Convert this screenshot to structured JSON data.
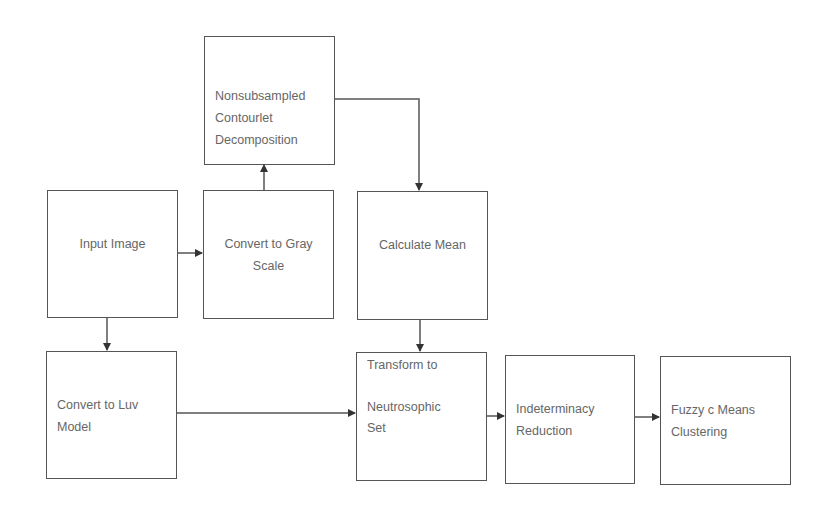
{
  "diagram": {
    "type": "flowchart",
    "nodes": [
      {
        "id": "nsct",
        "label_lines": [
          "Nonsubsampled",
          "Contourlet",
          "Decomposition"
        ]
      },
      {
        "id": "input",
        "label_lines": [
          "Input Image"
        ]
      },
      {
        "id": "gray",
        "label_lines": [
          "Convert to Gray",
          "Scale"
        ]
      },
      {
        "id": "mean",
        "label_lines": [
          "Calculate Mean"
        ]
      },
      {
        "id": "luv",
        "label_lines": [
          "Convert to Luv",
          "Model"
        ]
      },
      {
        "id": "ns",
        "label_lines": [
          "Transform to",
          "",
          "Neutrosophic",
          "Set"
        ]
      },
      {
        "id": "ind",
        "label_lines": [
          "Indeterminacy",
          "Reduction"
        ]
      },
      {
        "id": "fcm",
        "label_lines": [
          "Fuzzy c Means",
          "Clustering"
        ]
      }
    ],
    "edges": [
      {
        "from": "input",
        "to": "gray"
      },
      {
        "from": "gray",
        "to": "nsct"
      },
      {
        "from": "nsct",
        "to": "mean"
      },
      {
        "from": "input",
        "to": "luv"
      },
      {
        "from": "mean",
        "to": "ns"
      },
      {
        "from": "luv",
        "to": "ns"
      },
      {
        "from": "ns",
        "to": "ind"
      },
      {
        "from": "ind",
        "to": "fcm"
      }
    ],
    "colors": {
      "border": "#555555",
      "text": "#666666",
      "background": "#ffffff"
    }
  }
}
